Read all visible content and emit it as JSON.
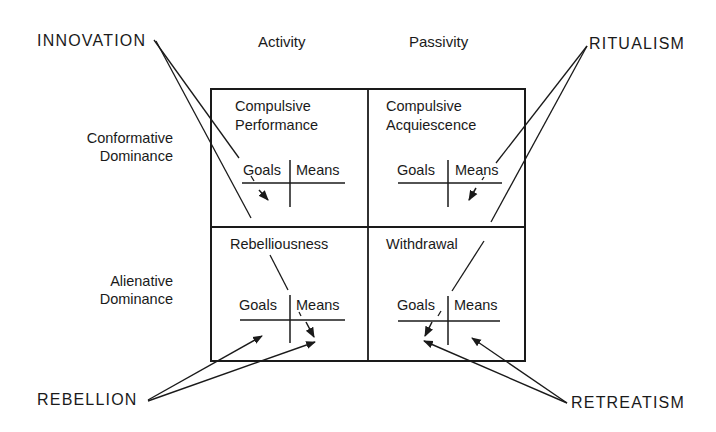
{
  "diagram": {
    "columns": [
      "Activity",
      "Passivity"
    ],
    "rows": [
      {
        "line1": "Conformative",
        "line2": "Dominance"
      },
      {
        "line1": "Alienative",
        "line2": "Dominance"
      }
    ],
    "cells": [
      {
        "line1": "Compulsive",
        "line2": "Performance",
        "goals": "Goals",
        "means": "Means"
      },
      {
        "line1": "Compulsive",
        "line2": "Acquiescence",
        "goals": "Goals",
        "means": "Means"
      },
      {
        "line1": "Rebelliousness",
        "line2": "",
        "goals": "Goals",
        "means": "Means"
      },
      {
        "line1": "Withdrawal",
        "line2": "",
        "goals": "Goals",
        "means": "Means"
      }
    ],
    "adaptations": {
      "top_left": "INNOVATION",
      "top_right": "RITUALISM",
      "bottom_left": "REBELLION",
      "bottom_right": "RETREATISM"
    },
    "colors": {
      "ink": "#1a1a1a",
      "background": "#ffffff"
    }
  }
}
